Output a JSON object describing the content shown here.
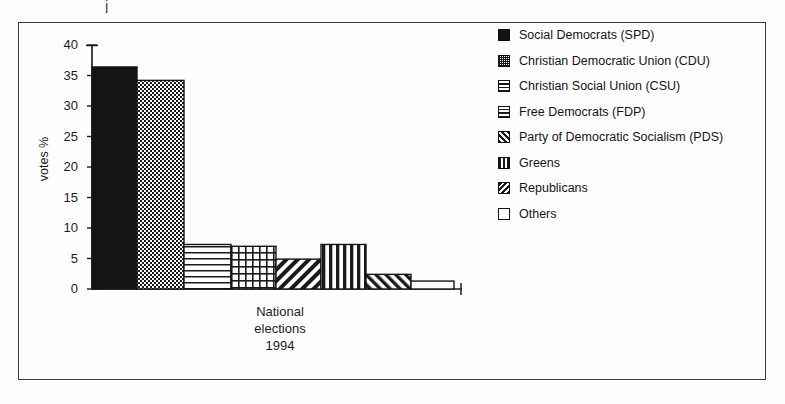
{
  "scan_artifact": "j",
  "chart_data": {
    "type": "bar",
    "title": "",
    "xlabel": "National elections 1994",
    "xlabel_lines": [
      "National",
      "elections",
      "1994"
    ],
    "ylabel": "votes %",
    "ylim": [
      0,
      40
    ],
    "yticks": [
      0,
      5,
      10,
      15,
      20,
      25,
      30,
      35,
      40
    ],
    "ytick_labels": [
      "0",
      "5",
      "10",
      "15",
      "20",
      "25",
      "30",
      "35",
      "40"
    ],
    "grid": false,
    "legend_position": "right",
    "categories": [
      "Social Democrats (SPD)",
      "Christian Democratic Union (CDU)",
      "Christian Social Union (CSU)",
      "Free Democrats (FDP)",
      "Party of Democratic Socialism (PDS)",
      "Greens",
      "Republicans",
      "Others"
    ],
    "values": [
      36.4,
      34.2,
      7.3,
      7.0,
      4.9,
      7.3,
      2.4,
      1.3
    ],
    "bars": [
      {
        "label": "Social Democrats (SPD)",
        "value": 36.4,
        "pattern": "solid-black"
      },
      {
        "label": "Christian Democratic Union (CDU)",
        "value": 34.2,
        "pattern": "dotted"
      },
      {
        "label": "Christian Social Union (CSU)",
        "value": 7.3,
        "pattern": "horizontal-lines"
      },
      {
        "label": "Free Democrats (FDP)",
        "value": 7.0,
        "pattern": "grid"
      },
      {
        "label": "Party of Democratic Socialism (PDS)",
        "value": 4.9,
        "pattern": "diagonal-forward"
      },
      {
        "label": "Greens",
        "value": 7.3,
        "pattern": "vertical-lines"
      },
      {
        "label": "Republicans",
        "value": 2.4,
        "pattern": "diagonal-back"
      },
      {
        "label": "Others",
        "value": 1.3,
        "pattern": "empty"
      }
    ]
  },
  "legend": {
    "items": [
      {
        "label": "Social Democrats (SPD)",
        "pattern": "solid-black"
      },
      {
        "label": "Christian Democratic Union (CDU)",
        "pattern": "dotted"
      },
      {
        "label": "Christian Social Union (CSU)",
        "pattern": "horizontal-lines"
      },
      {
        "label": "Free Democrats (FDP)",
        "pattern": "grid"
      },
      {
        "label": "Party of Democratic Socialism (PDS)",
        "pattern": "diagonal-forward"
      },
      {
        "label": "Greens",
        "pattern": "vertical-lines"
      },
      {
        "label": "Republicans",
        "pattern": "diagonal-back"
      },
      {
        "label": "Others",
        "pattern": "empty"
      }
    ]
  },
  "colors": {
    "ink": "#141414",
    "frame": "#3a3a3a",
    "paper": "#fefefe"
  }
}
